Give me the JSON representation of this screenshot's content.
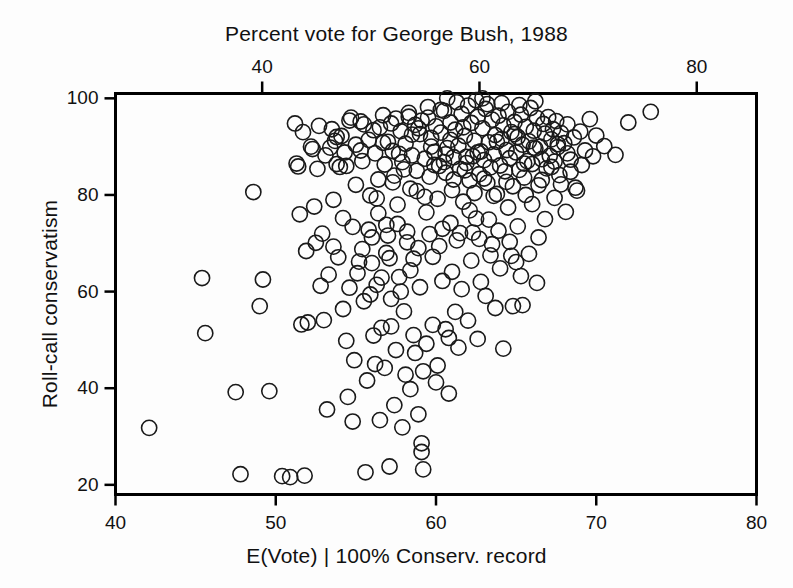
{
  "chart_data": {
    "type": "scatter",
    "title": "Percent vote for George Bush, 1988",
    "xlabel": "E(Vote) | 100% Conserv. record",
    "ylabel": "Roll-call conservatism",
    "top_axis_label": "Percent vote for George Bush, 1988",
    "grid": false,
    "legend": "none",
    "marker": "open-circle",
    "marker_color": "#1a1a1a",
    "marker_fill": "none",
    "background_color": "#fdfdfd",
    "axis_color": "#000000",
    "xlim": [
      40,
      80
    ],
    "ylim": [
      18,
      101
    ],
    "xticks": [
      40,
      50,
      60,
      70,
      80
    ],
    "yticks": [
      20,
      40,
      60,
      80,
      100
    ],
    "xticklabels": [
      "40",
      "50",
      "60",
      "70",
      "80"
    ],
    "yticklabels": [
      "20",
      "40",
      "60",
      "80",
      "100"
    ],
    "top_axis": {
      "label": "Percent vote for George Bush, 1988",
      "ticks": [
        40,
        60,
        80
      ],
      "ticklabels": [
        "40",
        "60",
        "80"
      ],
      "lim": [
        26.5,
        85.5
      ]
    },
    "n_points": 329,
    "points": [
      [
        42.1,
        31.8
      ],
      [
        45.4,
        62.8
      ],
      [
        45.6,
        51.4
      ],
      [
        47.5,
        39.2
      ],
      [
        47.8,
        22.2
      ],
      [
        48.6,
        80.6
      ],
      [
        49.0,
        57.0
      ],
      [
        49.2,
        62.5
      ],
      [
        49.6,
        39.4
      ],
      [
        50.4,
        21.8
      ],
      [
        50.9,
        21.6
      ],
      [
        51.2,
        94.8
      ],
      [
        51.3,
        86.5
      ],
      [
        51.4,
        85.9
      ],
      [
        51.5,
        76.0
      ],
      [
        51.6,
        53.2
      ],
      [
        51.8,
        21.9
      ],
      [
        52.0,
        53.6
      ],
      [
        52.3,
        89.5
      ],
      [
        52.5,
        70.1
      ],
      [
        52.8,
        61.2
      ],
      [
        53.0,
        54.1
      ],
      [
        53.2,
        35.6
      ],
      [
        53.4,
        89.8
      ],
      [
        53.6,
        69.3
      ],
      [
        53.8,
        92.0
      ],
      [
        54.0,
        85.8
      ],
      [
        54.2,
        56.4
      ],
      [
        54.4,
        49.8
      ],
      [
        54.5,
        38.2
      ],
      [
        54.6,
        95.4
      ],
      [
        54.8,
        33.1
      ],
      [
        55.0,
        82.1
      ],
      [
        55.1,
        63.8
      ],
      [
        55.3,
        95.2
      ],
      [
        55.4,
        87.0
      ],
      [
        55.5,
        58.0
      ],
      [
        55.6,
        22.6
      ],
      [
        55.8,
        91.4
      ],
      [
        55.9,
        79.9
      ],
      [
        56.0,
        71.2
      ],
      [
        56.1,
        50.9
      ],
      [
        56.2,
        88.6
      ],
      [
        56.3,
        61.4
      ],
      [
        56.4,
        83.2
      ],
      [
        56.5,
        94.0
      ],
      [
        56.6,
        52.5
      ],
      [
        56.7,
        96.5
      ],
      [
        56.8,
        86.3
      ],
      [
        56.9,
        73.8
      ],
      [
        57.0,
        91.0
      ],
      [
        57.1,
        66.9
      ],
      [
        57.2,
        52.8
      ],
      [
        57.3,
        89.1
      ],
      [
        57.4,
        84.0
      ],
      [
        57.5,
        95.8
      ],
      [
        57.6,
        78.0
      ],
      [
        57.7,
        63.0
      ],
      [
        57.8,
        93.2
      ],
      [
        57.9,
        86.8
      ],
      [
        58.0,
        55.9
      ],
      [
        58.1,
        90.6
      ],
      [
        58.2,
        72.4
      ],
      [
        58.3,
        97.0
      ],
      [
        58.4,
        81.3
      ],
      [
        58.5,
        88.2
      ],
      [
        58.6,
        51.0
      ],
      [
        58.7,
        94.5
      ],
      [
        58.8,
        85.0
      ],
      [
        58.9,
        69.0
      ],
      [
        59.0,
        92.6
      ],
      [
        59.1,
        28.6
      ],
      [
        59.1,
        26.8
      ],
      [
        59.2,
        23.2
      ],
      [
        59.3,
        87.5
      ],
      [
        59.4,
        76.4
      ],
      [
        59.5,
        96.0
      ],
      [
        59.6,
        83.8
      ],
      [
        59.7,
        91.8
      ],
      [
        59.8,
        67.2
      ],
      [
        59.9,
        88.9
      ],
      [
        60.0,
        94.2
      ],
      [
        60.1,
        79.2
      ],
      [
        60.2,
        86.0
      ],
      [
        60.3,
        92.9
      ],
      [
        60.4,
        73.0
      ],
      [
        60.5,
        97.4
      ],
      [
        60.6,
        84.6
      ],
      [
        60.7,
        89.7
      ],
      [
        60.8,
        50.4
      ],
      [
        60.9,
        95.0
      ],
      [
        61.0,
        81.0
      ],
      [
        61.1,
        87.8
      ],
      [
        61.2,
        93.5
      ],
      [
        61.3,
        70.6
      ],
      [
        61.4,
        90.2
      ],
      [
        61.5,
        85.4
      ],
      [
        61.6,
        96.8
      ],
      [
        61.7,
        78.6
      ],
      [
        61.8,
        92.2
      ],
      [
        61.9,
        86.6
      ],
      [
        62.0,
        98.5
      ],
      [
        62.1,
        83.0
      ],
      [
        62.2,
        94.9
      ],
      [
        62.3,
        88.0
      ],
      [
        62.4,
        91.2
      ],
      [
        62.5,
        75.1
      ],
      [
        62.6,
        96.2
      ],
      [
        62.7,
        84.3
      ],
      [
        62.8,
        89.0
      ],
      [
        62.9,
        93.8
      ],
      [
        63.0,
        87.2
      ],
      [
        63.1,
        97.8
      ],
      [
        63.2,
        82.5
      ],
      [
        63.3,
        90.9
      ],
      [
        63.4,
        85.7
      ],
      [
        63.5,
        95.6
      ],
      [
        63.6,
        88.4
      ],
      [
        63.7,
        92.4
      ],
      [
        63.8,
        80.2
      ],
      [
        63.9,
        96.4
      ],
      [
        64.0,
        86.1
      ],
      [
        64.1,
        91.6
      ],
      [
        64.2,
        94.4
      ],
      [
        64.3,
        84.9
      ],
      [
        64.4,
        89.3
      ],
      [
        64.5,
        97.2
      ],
      [
        64.6,
        87.6
      ],
      [
        64.7,
        93.0
      ],
      [
        64.8,
        81.8
      ],
      [
        64.9,
        95.1
      ],
      [
        65.0,
        88.8
      ],
      [
        65.1,
        92.0
      ],
      [
        65.2,
        85.2
      ],
      [
        65.3,
        96.6
      ],
      [
        65.4,
        90.4
      ],
      [
        65.5,
        83.6
      ],
      [
        65.6,
        94.1
      ],
      [
        65.7,
        87.0
      ],
      [
        65.8,
        91.1
      ],
      [
        65.9,
        98.0
      ],
      [
        66.0,
        86.4
      ],
      [
        66.1,
        93.3
      ],
      [
        66.2,
        89.6
      ],
      [
        66.3,
        95.9
      ],
      [
        66.4,
        82.0
      ],
      [
        66.5,
        90.0
      ],
      [
        66.6,
        87.4
      ],
      [
        66.7,
        94.7
      ],
      [
        66.8,
        92.7
      ],
      [
        66.9,
        85.5
      ],
      [
        67.0,
        96.1
      ],
      [
        67.1,
        88.1
      ],
      [
        67.2,
        91.5
      ],
      [
        67.3,
        93.6
      ],
      [
        67.4,
        86.9
      ],
      [
        67.5,
        95.3
      ],
      [
        67.6,
        89.9
      ],
      [
        67.7,
        84.1
      ],
      [
        67.8,
        92.8
      ],
      [
        68.0,
        90.7
      ],
      [
        68.2,
        94.6
      ],
      [
        68.4,
        87.3
      ],
      [
        68.6,
        91.9
      ],
      [
        68.8,
        80.9
      ],
      [
        69.0,
        93.1
      ],
      [
        69.3,
        89.2
      ],
      [
        69.6,
        95.7
      ],
      [
        70.0,
        92.3
      ],
      [
        70.5,
        90.1
      ],
      [
        71.2,
        88.3
      ],
      [
        72.0,
        95.0
      ],
      [
        73.4,
        97.2
      ],
      [
        56.2,
        45.0
      ],
      [
        56.8,
        44.2
      ],
      [
        57.4,
        36.5
      ],
      [
        57.9,
        31.9
      ],
      [
        58.4,
        39.8
      ],
      [
        55.7,
        41.6
      ],
      [
        54.9,
        45.8
      ],
      [
        56.5,
        33.4
      ],
      [
        57.1,
        23.8
      ],
      [
        58.9,
        34.6
      ],
      [
        59.4,
        49.2
      ],
      [
        60.1,
        44.7
      ],
      [
        60.8,
        38.9
      ],
      [
        61.4,
        48.4
      ],
      [
        62.0,
        54.0
      ],
      [
        62.6,
        50.2
      ],
      [
        63.1,
        59.1
      ],
      [
        63.7,
        56.6
      ],
      [
        64.2,
        48.2
      ],
      [
        64.8,
        57.0
      ],
      [
        65.4,
        57.2
      ],
      [
        60.4,
        62.2
      ],
      [
        61.0,
        64.1
      ],
      [
        61.6,
        60.5
      ],
      [
        62.2,
        66.4
      ],
      [
        62.8,
        62.0
      ],
      [
        63.4,
        67.5
      ],
      [
        64.0,
        64.8
      ],
      [
        64.6,
        70.3
      ],
      [
        65.0,
        66.1
      ],
      [
        59.0,
        60.9
      ],
      [
        58.4,
        64.4
      ],
      [
        57.8,
        60.0
      ],
      [
        57.2,
        58.5
      ],
      [
        56.6,
        62.9
      ],
      [
        55.9,
        59.4
      ],
      [
        55.2,
        66.2
      ],
      [
        54.6,
        60.8
      ],
      [
        53.9,
        67.1
      ],
      [
        53.3,
        63.5
      ],
      [
        59.6,
        71.9
      ],
      [
        60.2,
        69.4
      ],
      [
        60.9,
        74.2
      ],
      [
        61.5,
        72.1
      ],
      [
        62.1,
        76.8
      ],
      [
        62.7,
        70.9
      ],
      [
        63.3,
        74.9
      ],
      [
        63.9,
        72.6
      ],
      [
        64.5,
        77.4
      ],
      [
        65.1,
        73.5
      ],
      [
        58.2,
        70.2
      ],
      [
        57.6,
        74.0
      ],
      [
        57.0,
        71.6
      ],
      [
        56.4,
        76.2
      ],
      [
        55.8,
        72.8
      ],
      [
        59.8,
        53.1
      ],
      [
        60.6,
        52.2
      ],
      [
        61.2,
        55.8
      ],
      [
        65.8,
        67.8
      ],
      [
        66.4,
        71.2
      ],
      [
        66.0,
        78.1
      ],
      [
        66.8,
        75.0
      ],
      [
        67.4,
        79.4
      ],
      [
        68.1,
        76.5
      ],
      [
        68.7,
        81.5
      ],
      [
        59.2,
        43.5
      ],
      [
        60.0,
        41.2
      ],
      [
        58.7,
        47.3
      ],
      [
        58.1,
        42.8
      ],
      [
        57.5,
        47.9
      ],
      [
        61.8,
        85.1
      ],
      [
        62.4,
        80.4
      ],
      [
        63.0,
        83.4
      ],
      [
        63.6,
        79.8
      ],
      [
        64.4,
        82.7
      ],
      [
        65.6,
        80.0
      ],
      [
        66.6,
        83.1
      ],
      [
        67.2,
        85.8
      ],
      [
        67.8,
        82.2
      ],
      [
        68.4,
        84.8
      ],
      [
        54.2,
        75.2
      ],
      [
        53.6,
        79.0
      ],
      [
        52.9,
        72.0
      ],
      [
        52.4,
        77.6
      ],
      [
        51.9,
        68.4
      ],
      [
        55.4,
        68.8
      ],
      [
        54.8,
        73.4
      ],
      [
        56.0,
        65.9
      ],
      [
        56.9,
        68.0
      ],
      [
        58.6,
        66.8
      ],
      [
        59.9,
        86.2
      ],
      [
        58.8,
        80.8
      ],
      [
        58.0,
        85.3
      ],
      [
        57.3,
        82.6
      ],
      [
        56.3,
        79.3
      ],
      [
        60.7,
        100.0
      ],
      [
        61.3,
        99.2
      ],
      [
        62.5,
        99.6
      ],
      [
        63.2,
        98.8
      ],
      [
        64.1,
        99.0
      ],
      [
        59.5,
        98.2
      ],
      [
        65.2,
        98.6
      ],
      [
        66.2,
        99.4
      ],
      [
        60.3,
        97.6
      ],
      [
        62.9,
        100.0
      ],
      [
        55.0,
        90.4
      ],
      [
        54.4,
        86.0
      ],
      [
        53.7,
        91.2
      ],
      [
        53.1,
        88.2
      ],
      [
        52.6,
        85.4
      ],
      [
        59.3,
        79.6
      ],
      [
        60.5,
        86.8
      ],
      [
        61.1,
        83.2
      ],
      [
        61.9,
        87.9
      ],
      [
        65.5,
        86.5
      ],
      [
        66.1,
        89.8
      ],
      [
        67.6,
        90.5
      ],
      [
        68.2,
        88.6
      ],
      [
        69.1,
        86.2
      ],
      [
        69.8,
        88.0
      ],
      [
        62.3,
        72.2
      ],
      [
        63.5,
        69.8
      ],
      [
        64.7,
        67.4
      ],
      [
        65.3,
        63.2
      ],
      [
        66.3,
        61.8
      ],
      [
        56.7,
        90.8
      ],
      [
        57.7,
        88.5
      ],
      [
        58.5,
        92.5
      ],
      [
        59.7,
        90.0
      ],
      [
        60.6,
        88.4
      ],
      [
        51.7,
        93.0
      ],
      [
        52.2,
        90.0
      ],
      [
        52.7,
        94.3
      ],
      [
        53.5,
        93.6
      ],
      [
        54.1,
        92.2
      ],
      [
        54.7,
        96.0
      ],
      [
        55.5,
        94.6
      ],
      [
        56.1,
        93.4
      ],
      [
        57.2,
        94.8
      ],
      [
        58.3,
        96.2
      ],
      [
        64.9,
        92.6
      ],
      [
        63.8,
        91.0
      ],
      [
        62.6,
        88.8
      ],
      [
        61.7,
        94.0
      ],
      [
        60.9,
        91.4
      ],
      [
        59.1,
        95.4
      ],
      [
        58.9,
        93.8
      ],
      [
        55.3,
        89.2
      ],
      [
        54.3,
        88.8
      ],
      [
        53.8,
        86.4
      ]
    ]
  },
  "axes": {
    "top_title": "Percent vote for George Bush, 1988",
    "bottom_label": "E(Vote) | 100% Conserv. record",
    "left_label": "Roll-call conservatism"
  }
}
